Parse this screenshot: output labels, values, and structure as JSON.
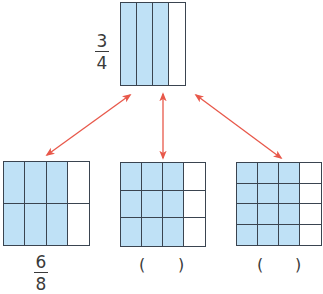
{
  "colors": {
    "fill": "#bfe1f6",
    "grid_line": "#3a4450",
    "arrow": "#e8584a"
  },
  "top_model": {
    "label": {
      "numerator": "3",
      "denominator": "4"
    },
    "rows": 1,
    "cols": 4,
    "shaded_cols": 3
  },
  "bottom_models": [
    {
      "rows": 2,
      "cols": 4,
      "shaded_cols": 3,
      "label": {
        "numerator": "6",
        "denominator": "8"
      }
    },
    {
      "rows": 3,
      "cols": 4,
      "shaded_cols": 3,
      "answer_blank": {
        "open": "(",
        "close": ")"
      }
    },
    {
      "rows": 4,
      "cols": 4,
      "shaded_cols": 3,
      "answer_blank": {
        "open": "(",
        "close": ")"
      }
    }
  ],
  "arrows": [
    {
      "name": "arrow-to-left-model",
      "x1": 130,
      "y1": 95,
      "x2": 47,
      "y2": 155
    },
    {
      "name": "arrow-to-middle-model",
      "x1": 163,
      "y1": 94,
      "x2": 163,
      "y2": 158
    },
    {
      "name": "arrow-to-right-model",
      "x1": 196,
      "y1": 95,
      "x2": 281,
      "y2": 158
    }
  ]
}
